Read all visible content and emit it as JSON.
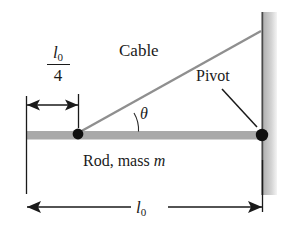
{
  "figure": {
    "type": "free-body-diagram",
    "labels": {
      "cable": "Cable",
      "theta": "θ",
      "pivot": "Pivot",
      "rod": "Rod, mass ",
      "rod_mass_symbol": "m",
      "length_symbol": "l",
      "length_subscript": "0",
      "quarter_numerator_symbol": "l",
      "quarter_numerator_subscript": "0",
      "quarter_denominator": "4"
    },
    "dimensions": [
      {
        "name": "quarter-length",
        "value": "l0/4",
        "position": "top-left",
        "style": "double-headed-arrow"
      },
      {
        "name": "full-length",
        "value": "l0",
        "position": "bottom",
        "style": "double-headed-arrow"
      }
    ],
    "colors": {
      "rod": "#a9a9a9",
      "cable": "#8c8c8c",
      "wall_line": "#4a4a4a",
      "wall_shadow": "#c9c9c9",
      "ink": "#1a1a1a",
      "background": "#ffffff"
    },
    "points": [
      {
        "name": "cable-attachment",
        "x": 78,
        "y": 135
      },
      {
        "name": "pivot",
        "x": 262,
        "y": 135
      }
    ]
  }
}
